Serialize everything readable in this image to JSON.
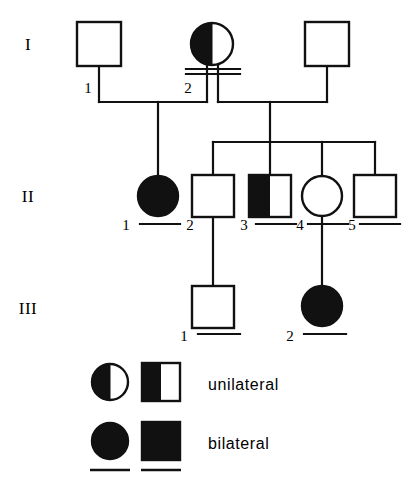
{
  "figure": {
    "type": "pedigree-chart",
    "stroke_color": "#111111",
    "fill_affected": "#111111",
    "fill_unaffected": "#ffffff",
    "background": "#ffffff"
  },
  "generations": [
    {
      "id": "I",
      "label": "I",
      "label_x": 28,
      "label_y": 48
    },
    {
      "id": "II",
      "label": "II",
      "label_x": 24,
      "label_y": 200
    },
    {
      "id": "III",
      "label": "III",
      "label_x": 20,
      "label_y": 312
    }
  ],
  "individuals": [
    {
      "id": "I-1",
      "generation": "I",
      "number": "1",
      "sex": "male",
      "shape": "square",
      "status": "unaffected",
      "fill": "none",
      "cx": 99,
      "cy": 44,
      "size": 44,
      "num_x": 88,
      "num_y": 88,
      "underline": false
    },
    {
      "id": "I-2",
      "generation": "I",
      "number": "2",
      "sex": "female",
      "shape": "circle",
      "status": "unilateral",
      "fill": "left-half",
      "cx": 212,
      "cy": 44,
      "size": 42,
      "num_x": 186,
      "num_y": 88,
      "underline": false
    },
    {
      "id": "I-3",
      "generation": "I",
      "number": "",
      "sex": "male",
      "shape": "square",
      "status": "unaffected",
      "fill": "none",
      "cx": 327,
      "cy": 44,
      "size": 44,
      "num_x": 0,
      "num_y": 0,
      "underline": false
    },
    {
      "id": "II-1",
      "generation": "II",
      "number": "1",
      "sex": "female",
      "shape": "circle",
      "status": "bilateral",
      "fill": "full",
      "cx": 158,
      "cy": 196,
      "size": 40,
      "num_x": 126,
      "num_y": 230,
      "underline": false
    },
    {
      "id": "II-2",
      "generation": "II",
      "number": "2",
      "sex": "male",
      "shape": "square",
      "status": "unaffected",
      "fill": "none",
      "cx": 213,
      "cy": 196,
      "size": 42,
      "num_x": 186,
      "num_y": 230,
      "underline": false
    },
    {
      "id": "II-3",
      "generation": "II",
      "number": "3",
      "sex": "male",
      "shape": "square",
      "status": "unilateral",
      "fill": "left-half",
      "cx": 270,
      "cy": 196,
      "size": 42,
      "num_x": 242,
      "num_y": 230,
      "underline": false
    },
    {
      "id": "II-4",
      "generation": "II",
      "number": "4",
      "sex": "female",
      "shape": "circle",
      "status": "unaffected",
      "fill": "none",
      "cx": 322,
      "cy": 196,
      "size": 40,
      "num_x": 296,
      "num_y": 230,
      "underline": false
    },
    {
      "id": "II-5",
      "generation": "II",
      "number": "5",
      "sex": "male",
      "shape": "square",
      "status": "unaffected",
      "fill": "none",
      "cx": 375,
      "cy": 196,
      "size": 42,
      "num_x": 348,
      "num_y": 230,
      "underline": false
    },
    {
      "id": "III-1",
      "generation": "III",
      "number": "1",
      "sex": "male",
      "shape": "square",
      "status": "unaffected",
      "fill": "none",
      "cx": 213,
      "cy": 306,
      "size": 42,
      "num_x": 186,
      "num_y": 340,
      "underline": true
    },
    {
      "id": "III-2",
      "generation": "III",
      "number": "2",
      "sex": "female",
      "shape": "circle",
      "status": "bilateral",
      "fill": "full",
      "cx": 322,
      "cy": 306,
      "size": 40,
      "num_x": 292,
      "num_y": 340,
      "underline": true
    }
  ],
  "legend": {
    "rows": [
      {
        "id": "legend-unilateral",
        "label": "unilateral",
        "fill": "left-half",
        "circle_cx": 110,
        "circle_cy": 382,
        "circle_size": 36,
        "square_cx": 161,
        "square_cy": 382,
        "square_size": 38,
        "text_x": 208,
        "text_y": 390,
        "underline": false
      },
      {
        "id": "legend-bilateral",
        "label": "bilateral",
        "fill": "full",
        "circle_cx": 110,
        "circle_cy": 443,
        "circle_size": 36,
        "square_cx": 161,
        "square_cy": 443,
        "square_size": 38,
        "text_x": 208,
        "text_y": 451,
        "underline": true
      }
    ]
  },
  "connections": {
    "description": "Pedigree relationship lines",
    "mating_lines": [
      {
        "id": "mating-I1-I2",
        "note": "I-1 x I-2 union"
      },
      {
        "id": "mating-I2-I3",
        "note": "I-2 x I-3 union"
      },
      {
        "id": "mating-II1-II2",
        "note": "II-1 x II-2 union"
      },
      {
        "id": "mating-II3-II4",
        "note": "II-3 x II-4 union"
      },
      {
        "id": "mating-II4-II5",
        "note": "II-4 x II-5 union"
      }
    ],
    "sibships": [
      {
        "id": "sibship-II-left",
        "note": "II-1 descends from I-1 x I-2"
      },
      {
        "id": "sibship-II-right",
        "note": "II-2..II-5 sibship bar from I-2 x I-3"
      }
    ],
    "children": [
      {
        "id": "child-III-1",
        "note": "III-1 from II-1 x II-2"
      },
      {
        "id": "child-III-2",
        "note": "III-2 from II-4 x II-5"
      }
    ]
  }
}
